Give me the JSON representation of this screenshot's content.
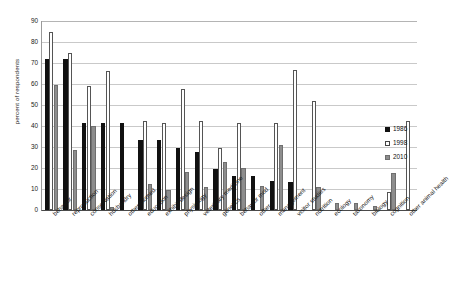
{
  "chart_data": {
    "type": "bar",
    "title": "",
    "xlabel": "",
    "ylabel": "percent of respondents",
    "ylim": [
      0,
      90
    ],
    "ytick_step": 10,
    "yticks": [
      0,
      10,
      20,
      30,
      40,
      50,
      60,
      70,
      80,
      90
    ],
    "grid": true,
    "legend_position": "right",
    "categories": [
      "behavior",
      "reproduction",
      "conservation",
      "husbandry",
      "other biomed",
      "education",
      "exhibit design",
      "physiology",
      "veterinary medicine",
      "genetics",
      "behavior mod",
      "other",
      "management",
      "visitor studies",
      "nutrition",
      "ecology",
      "taxonomy",
      "biology",
      "cognition",
      "other animal health"
    ],
    "series": [
      {
        "name": "1986",
        "color": "#111111",
        "values": [
          72,
          72,
          41.5,
          41.5,
          41.5,
          33.5,
          33.5,
          29.5,
          27.5,
          19.5,
          16,
          16,
          14,
          13.5,
          0,
          0,
          0,
          0,
          0,
          0
        ]
      },
      {
        "name": "1998",
        "color": "#ffffff",
        "values": [
          85,
          75,
          59,
          66,
          0,
          42.5,
          41.5,
          57.5,
          42.5,
          29.5,
          41.5,
          0,
          41.5,
          66.5,
          52,
          0,
          0,
          0,
          8.5,
          42.5
        ]
      },
      {
        "name": "2010",
        "color": "#8d8d8d",
        "values": [
          59.5,
          28.5,
          40,
          1.5,
          0,
          12.5,
          9.5,
          18,
          11,
          23,
          20,
          11.5,
          31,
          0,
          11,
          3.5,
          3.5,
          2,
          17.5,
          0
        ]
      }
    ]
  },
  "legend": {
    "items": [
      {
        "label": "1986",
        "series": "s1986"
      },
      {
        "label": "1998",
        "series": "s1998"
      },
      {
        "label": "2010",
        "series": "s2010"
      }
    ]
  }
}
